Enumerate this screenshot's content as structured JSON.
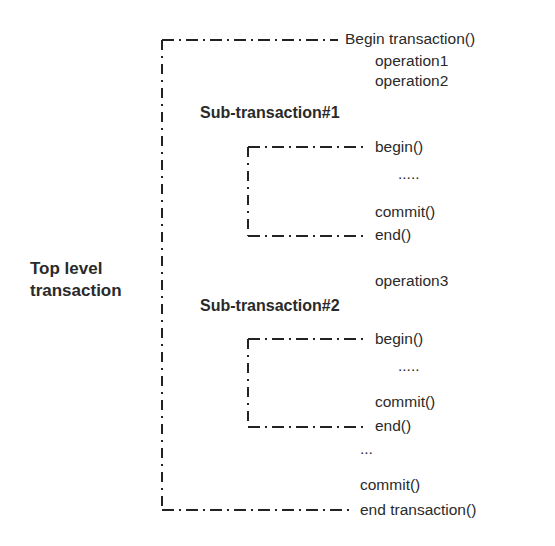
{
  "diagram": {
    "top_label": [
      "Top level",
      "transaction"
    ],
    "top": {
      "begin": "Begin transaction()",
      "ops_before": [
        "operation1",
        "operation2"
      ],
      "op_middle": "operation3",
      "ellipsis": "...",
      "commit": "commit()",
      "end": "end transaction()"
    },
    "sub1": {
      "label": "Sub-transaction#1",
      "begin": "begin()",
      "ellipsis": ".....",
      "commit": "commit()",
      "end": "end()"
    },
    "sub2": {
      "label": "Sub-transaction#2",
      "begin": "begin()",
      "ellipsis": ".....",
      "commit": "commit()",
      "end": "end()"
    },
    "colors": {
      "line": "#222222",
      "text": "#2a2a2a",
      "background": "#ffffff"
    }
  }
}
